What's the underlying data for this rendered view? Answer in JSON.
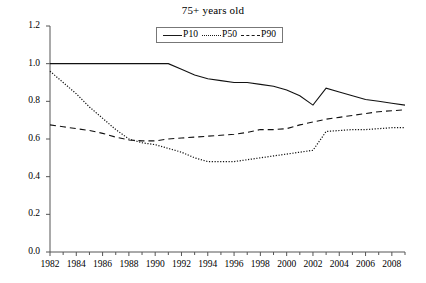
{
  "chart_data": {
    "type": "line",
    "title": "75+ years old",
    "xlabel": "",
    "ylabel": "",
    "xlim": [
      1982,
      2009
    ],
    "ylim": [
      0.0,
      1.2
    ],
    "grid": false,
    "legend_position": "top-center",
    "x": [
      1982,
      1983,
      1984,
      1985,
      1986,
      1987,
      1988,
      1989,
      1990,
      1991,
      1992,
      1993,
      1994,
      1995,
      1996,
      1997,
      1998,
      1999,
      2000,
      2001,
      2002,
      2003,
      2004,
      2005,
      2006,
      2007,
      2008,
      2009
    ],
    "xtick_labels": [
      "1982",
      "1984",
      "1986",
      "1988",
      "1990",
      "1992",
      "1994",
      "1996",
      "1998",
      "2000",
      "2002",
      "2004",
      "2006",
      "2008"
    ],
    "xtick_values": [
      1982,
      1984,
      1986,
      1988,
      1990,
      1992,
      1994,
      1996,
      1998,
      2000,
      2002,
      2004,
      2006,
      2008
    ],
    "ytick_labels": [
      "0.0",
      "0.2",
      "0.4",
      "0.6",
      "0.8",
      "1.0",
      "1.2"
    ],
    "ytick_values": [
      0.0,
      0.2,
      0.4,
      0.6,
      0.8,
      1.0,
      1.2
    ],
    "series": [
      {
        "name": "P10",
        "style": "solid",
        "color": "#111111",
        "values": [
          1.0,
          1.0,
          1.0,
          1.0,
          1.0,
          1.0,
          1.0,
          1.0,
          1.0,
          1.0,
          0.97,
          0.94,
          0.92,
          0.91,
          0.9,
          0.9,
          0.89,
          0.88,
          0.86,
          0.83,
          0.78,
          0.87,
          0.85,
          0.83,
          0.81,
          0.8,
          0.79,
          0.78
        ]
      },
      {
        "name": "P50",
        "style": "dotted",
        "color": "#111111",
        "values": [
          0.96,
          0.9,
          0.84,
          0.77,
          0.71,
          0.65,
          0.6,
          0.58,
          0.57,
          0.55,
          0.53,
          0.5,
          0.48,
          0.48,
          0.48,
          0.49,
          0.5,
          0.51,
          0.52,
          0.53,
          0.54,
          0.64,
          0.645,
          0.65,
          0.65,
          0.655,
          0.66,
          0.66
        ]
      },
      {
        "name": "P90",
        "style": "dashed",
        "color": "#111111",
        "values": [
          0.675,
          0.665,
          0.655,
          0.645,
          0.63,
          0.61,
          0.595,
          0.59,
          0.59,
          0.6,
          0.605,
          0.61,
          0.615,
          0.62,
          0.625,
          0.635,
          0.65,
          0.65,
          0.655,
          0.675,
          0.69,
          0.705,
          0.715,
          0.725,
          0.735,
          0.745,
          0.75,
          0.755
        ]
      }
    ]
  },
  "legend": {
    "items": [
      {
        "label": "P10",
        "style": "solid"
      },
      {
        "label": "P50",
        "style": "dotted"
      },
      {
        "label": "P90",
        "style": "dashed"
      }
    ]
  }
}
